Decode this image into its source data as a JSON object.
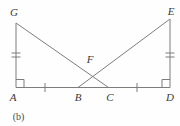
{
  "figure": {
    "caption": "(b)",
    "labels": {
      "G": "G",
      "E": "E",
      "F": "F",
      "A": "A",
      "B": "B",
      "C": "C",
      "D": "D"
    },
    "marks": {
      "right_angle_at": [
        "A",
        "D"
      ],
      "double_tick_segments": [
        "GA",
        "ED"
      ],
      "single_tick_segments": [
        "AB",
        "CD"
      ]
    },
    "colors": {
      "line": "#7d7d7d",
      "label_text": "#3a3a3a",
      "background": "#fefefe"
    }
  }
}
